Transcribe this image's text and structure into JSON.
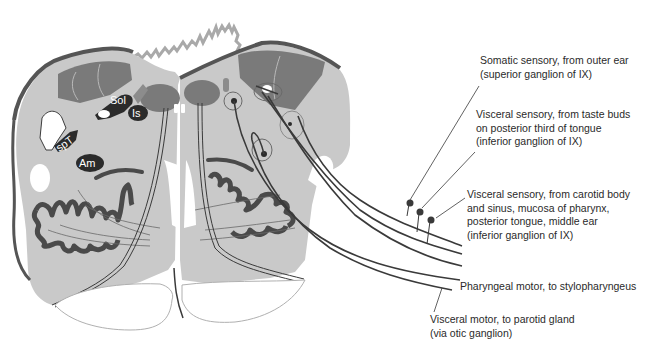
{
  "figure": {
    "colors": {
      "background": "#ffffff",
      "medulla_fill": "#c9c9c9",
      "dark_region": "#7a7a7a",
      "nucleus_fill": "#2b2b2b",
      "outline": "#3c3c3c",
      "olive": "#4a4a4a",
      "pyramid_fill": "#ffffff",
      "fiber": "#3a3a3a",
      "ventricle_edge": "#9a9a9a"
    },
    "nuclei": [
      {
        "abbr": "Sol",
        "meaning": "solitary nucleus"
      },
      {
        "abbr": "Is",
        "meaning": "inferior salivatory nucleus"
      },
      {
        "abbr": "spT",
        "meaning": "spinal trigeminal nucleus"
      },
      {
        "abbr": "Am",
        "meaning": "nucleus ambiguus"
      }
    ]
  },
  "labels": [
    {
      "id": "somatic-sensory",
      "lines": [
        "Somatic sensory, from outer ear",
        "(superior ganglion of IX)"
      ]
    },
    {
      "id": "visceral-sensory-taste",
      "lines": [
        "Visceral sensory, from taste buds",
        "on posterior third of tongue",
        "(inferior ganglion of IX)"
      ]
    },
    {
      "id": "visceral-sensory-carotid",
      "lines": [
        "Visceral sensory, from carotid body",
        "and sinus, mucosa of pharynx,",
        "posterior tongue, middle ear",
        "(inferior ganglion of IX)"
      ]
    },
    {
      "id": "pharyngeal-motor",
      "lines": [
        "Pharyngeal motor, to stylopharyngeus"
      ]
    },
    {
      "id": "visceral-motor",
      "lines": [
        "Visceral motor, to parotid gland",
        "(via otic ganglion)"
      ]
    }
  ]
}
